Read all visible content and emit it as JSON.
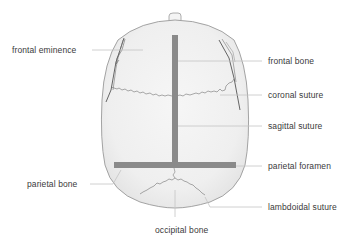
{
  "diagram": {
    "colors": {
      "background": "#ffffff",
      "skull_fill": "#f1f1f1",
      "skull_outline": "#9a9a9a",
      "marker_bar": "#8a8a8a",
      "leader_line": "#c4c4c4",
      "suture": "#666666",
      "label_text": "#3a3a3a"
    },
    "labels": {
      "frontal_eminence": "frontal eminence",
      "frontal_bone": "frontal bone",
      "coronal_suture": "coronal suture",
      "sagittal_suture": "sagittal suture",
      "parietal_foramen": "parietal foramen",
      "parietal_bone": "parietal bone",
      "lambdoidal_suture": "lambdoidal suture",
      "occipital_bone": "occipital bone"
    }
  }
}
